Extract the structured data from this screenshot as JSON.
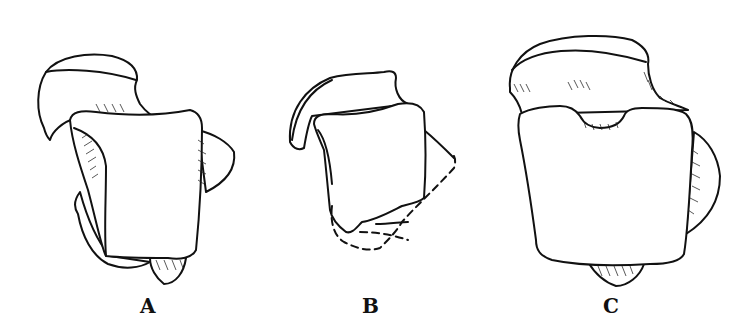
{
  "figure": {
    "panels": [
      {
        "id": "A",
        "label": "A"
      },
      {
        "id": "B",
        "label": "B"
      },
      {
        "id": "C",
        "label": "C"
      }
    ],
    "colors": {
      "line": "#111111",
      "background": "#ffffff"
    }
  }
}
